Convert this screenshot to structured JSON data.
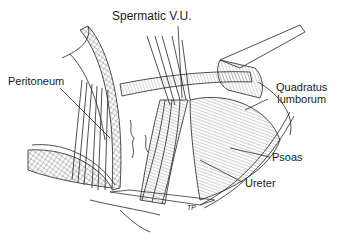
{
  "figure": {
    "type": "surgical anatomy illustration",
    "labels": [
      {
        "id": "spermatic",
        "text": "Spermatic V.U."
      },
      {
        "id": "peritoneum",
        "text": "Peritoneum"
      },
      {
        "id": "quadratus",
        "text": "Quadratus\nlumborum",
        "line1": "Quadratus",
        "line2": "lumborum"
      },
      {
        "id": "psoas",
        "text": "Psoas"
      },
      {
        "id": "ureter",
        "text": "Ureter"
      }
    ],
    "signature": "TP"
  },
  "colors": {
    "ink": "#1a1a1a",
    "background": "#ffffff"
  }
}
